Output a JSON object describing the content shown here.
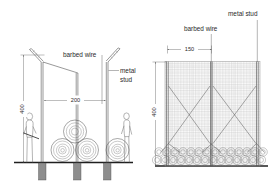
{
  "drawing": {
    "title": "Security fence detail drawing",
    "background_color": "#ffffff",
    "line_color": "#555555",
    "mesh_color": "#9a9a9a",
    "footing_color": "#8e8e8e"
  },
  "left_view": {
    "name": "side-elevation",
    "labels": {
      "barbed_wire": "barbed wire",
      "metal_line1": "metal",
      "metal_line2": "stud"
    },
    "dimensions": {
      "height": "400",
      "width": "200"
    },
    "features": {
      "posts": 3,
      "coils_bottom": 2,
      "coils_top": 1,
      "figures": 2,
      "footings": 3
    }
  },
  "right_view": {
    "name": "front-elevation",
    "labels": {
      "metal_stud": "metal stud",
      "barbed_wire": "barbed wire"
    },
    "dimensions": {
      "height": "400",
      "spacing": "150"
    },
    "features": {
      "studs": 3,
      "brace_panels": 2
    }
  }
}
